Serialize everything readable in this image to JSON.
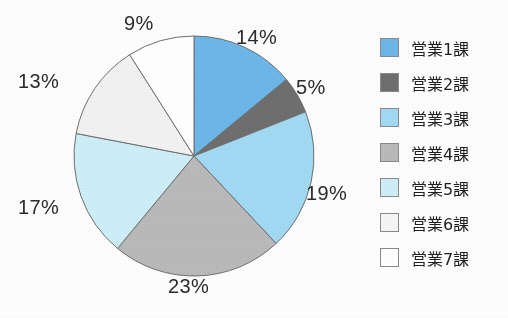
{
  "chart_data": {
    "type": "pie",
    "title": "",
    "categories": [
      "営業1課",
      "営業2課",
      "営業3課",
      "営業4課",
      "営業5課",
      "営業6課",
      "営業7課"
    ],
    "values": [
      14,
      5,
      19,
      23,
      17,
      13,
      9
    ],
    "value_labels": [
      "14%",
      "5%",
      "19%",
      "23%",
      "17%",
      "13%",
      "9%"
    ],
    "unit": "%",
    "start_angle_deg": 0,
    "direction": "clockwise",
    "legend_position": "right",
    "grid": false,
    "colors": [
      "#6cb6e8",
      "#6e6e6e",
      "#a2d9f2",
      "#b9b9b9",
      "#cdeef7",
      "#f1f1f1",
      "#ffffff"
    ],
    "slice_outline_color": "#6f6f6f"
  },
  "labels": [
    {
      "text": "14%",
      "left": 236,
      "top": 26
    },
    {
      "text": "5%",
      "left": 296,
      "top": 76
    },
    {
      "text": "19%",
      "left": 306,
      "top": 182
    },
    {
      "text": "23%",
      "left": 168,
      "top": 275
    },
    {
      "text": "17%",
      "left": 18,
      "top": 196
    },
    {
      "text": "13%",
      "left": 18,
      "top": 70
    },
    {
      "text": "9%",
      "left": 124,
      "top": 12
    }
  ],
  "legend": {
    "items": [
      {
        "label": "営業1課",
        "color": "#6cb6e8"
      },
      {
        "label": "営業2課",
        "color": "#6e6e6e"
      },
      {
        "label": "営業3課",
        "color": "#a2d9f2"
      },
      {
        "label": "営業4課",
        "color": "#b9b9b9"
      },
      {
        "label": "営業5課",
        "color": "#cdeef7"
      },
      {
        "label": "営業6課",
        "color": "#f5f5f5"
      },
      {
        "label": "営業7課",
        "color": "#ffffff"
      }
    ]
  }
}
